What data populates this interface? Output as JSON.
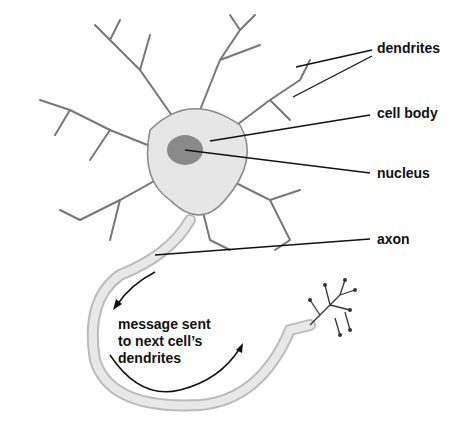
{
  "labels": {
    "dendrites": "dendrites",
    "cell_body": "cell body",
    "nucleus": "nucleus",
    "axon": "axon"
  },
  "message": {
    "line1": "message sent",
    "line2": "to next cell’s",
    "line3": "dendrites"
  },
  "colors": {
    "line": "#111111",
    "cell": "#e4e4e4",
    "nucleus": "#8a8a8a"
  }
}
